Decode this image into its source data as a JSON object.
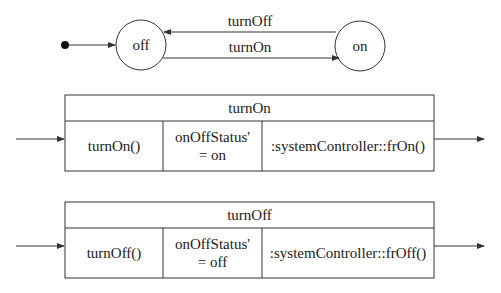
{
  "state_machine": {
    "initial_state": "off",
    "states": [
      {
        "id": "off",
        "label": "off"
      },
      {
        "id": "on",
        "label": "on"
      }
    ],
    "transitions": [
      {
        "from": "on",
        "to": "off",
        "label": "turnOff"
      },
      {
        "from": "off",
        "to": "on",
        "label": "turnOn"
      }
    ]
  },
  "operation_boxes": [
    {
      "title": "turnOn",
      "cells": [
        "turnOn()",
        "onOffStatus' = on",
        ":systemController::frOn()"
      ],
      "cell_lines": [
        [
          "turnOn()"
        ],
        [
          "onOffStatus'",
          "= on"
        ],
        [
          ":systemController::frOn()"
        ]
      ]
    },
    {
      "title": "turnOff",
      "cells": [
        "turnOff()",
        "onOffStatus' = off",
        ":systemController::frOff()"
      ],
      "cell_lines": [
        [
          "turnOff()"
        ],
        [
          "onOffStatus'",
          "= off"
        ],
        [
          ":systemController::frOff()"
        ]
      ]
    }
  ],
  "colors": {
    "line": "#333333",
    "text": "#1a1a1a",
    "background": "#ffffff"
  }
}
